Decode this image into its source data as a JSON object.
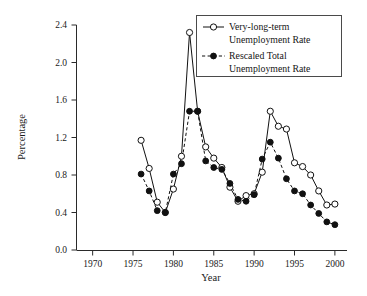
{
  "chart_data": {
    "type": "line",
    "title": "",
    "xlabel": "Year",
    "ylabel": "Percentage",
    "xlim": [
      1968,
      2001.5
    ],
    "ylim": [
      0.0,
      2.4
    ],
    "xticks": [
      1970,
      1975,
      1980,
      1985,
      1990,
      1995,
      2000
    ],
    "xtick_labels": [
      "1970",
      "1975",
      "1980",
      "1985",
      "1990",
      "1995",
      "2000"
    ],
    "yticks": [
      0.0,
      0.4,
      0.8,
      1.2,
      1.6,
      2.0,
      2.4
    ],
    "ytick_labels": [
      "0.0",
      "0.4",
      "0.8",
      "1.2",
      "1.6",
      "2.0",
      "2.4"
    ],
    "grid": false,
    "legend_position": "top-right",
    "x": [
      1976,
      1977,
      1978,
      1979,
      1980,
      1981,
      1982,
      1983,
      1984,
      1985,
      1986,
      1987,
      1988,
      1989,
      1990,
      1991,
      1992,
      1993,
      1994,
      1995,
      1996,
      1997,
      1998,
      1999,
      2000
    ],
    "series": [
      {
        "name": "Very-long-term Unemployment Rate",
        "marker": "open-circle",
        "line_style": "solid",
        "color": "#111111",
        "values": [
          1.17,
          0.87,
          0.51,
          0.4,
          0.65,
          1.0,
          2.32,
          1.48,
          1.1,
          0.98,
          0.88,
          0.67,
          0.52,
          0.58,
          0.6,
          0.83,
          1.48,
          1.32,
          1.29,
          0.93,
          0.89,
          0.8,
          0.63,
          0.48,
          0.49
        ]
      },
      {
        "name": "Rescaled Total Unemployment Rate",
        "marker": "filled-circle",
        "line_style": "dashed",
        "color": "#111111",
        "values": [
          0.81,
          0.63,
          0.42,
          0.4,
          0.81,
          0.92,
          1.48,
          1.48,
          0.95,
          0.88,
          0.86,
          0.71,
          0.54,
          0.52,
          0.59,
          0.97,
          1.15,
          0.98,
          0.76,
          0.63,
          0.6,
          0.48,
          0.39,
          0.3,
          0.27
        ]
      }
    ]
  },
  "legend": {
    "entries": [
      {
        "label_line1": "Very-long-term",
        "label_line2": "Unemployment Rate"
      },
      {
        "label_line1": "Rescaled Total",
        "label_line2": "Unemployment Rate"
      }
    ]
  },
  "axes": {
    "y_title": "Percentage",
    "x_title": "Year"
  }
}
